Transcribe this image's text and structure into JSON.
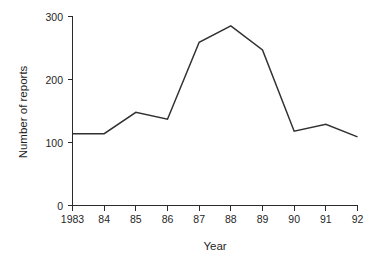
{
  "chart_data": {
    "type": "line",
    "title": "",
    "subtitle": "",
    "xlabel": "Year",
    "ylabel": "Number of reports",
    "categories": [
      "1983",
      "84",
      "85",
      "86",
      "87",
      "88",
      "89",
      "90",
      "91",
      "92"
    ],
    "x": [
      1983,
      1984,
      1985,
      1986,
      1987,
      1988,
      1989,
      1990,
      1991,
      1992
    ],
    "values": [
      114,
      114,
      148,
      137,
      259,
      285,
      247,
      118,
      129,
      109
    ],
    "series": [
      {
        "name": "Number of reports",
        "values": [
          114,
          114,
          148,
          137,
          259,
          285,
          247,
          118,
          129,
          109
        ]
      }
    ],
    "xlim": [
      1983,
      1992
    ],
    "ylim": [
      0,
      300
    ],
    "ytick_labels": [
      "0",
      "100",
      "200",
      "300"
    ],
    "ytick_values": [
      0,
      100,
      200,
      300
    ],
    "xtick_labels": [
      "1983",
      "84",
      "85",
      "86",
      "87",
      "88",
      "89",
      "90",
      "91",
      "92"
    ],
    "grid": false,
    "legend": false,
    "legend_position": "none",
    "line_color": "#33312f",
    "axis_color": "#2b2b2b",
    "background_color": "#ffffff",
    "annotations": []
  },
  "axes": {
    "y_title": "Number of reports",
    "x_title": "Year",
    "y_ticks": [
      {
        "label": "300",
        "value": 300
      },
      {
        "label": "200",
        "value": 200
      },
      {
        "label": "100",
        "value": 100
      },
      {
        "label": "0",
        "value": 0
      }
    ],
    "x_ticks": [
      {
        "label": "1983",
        "value": 1983
      },
      {
        "label": "84",
        "value": 1984
      },
      {
        "label": "85",
        "value": 1985
      },
      {
        "label": "86",
        "value": 1986
      },
      {
        "label": "87",
        "value": 1987
      },
      {
        "label": "88",
        "value": 1988
      },
      {
        "label": "89",
        "value": 1989
      },
      {
        "label": "90",
        "value": 1990
      },
      {
        "label": "91",
        "value": 1991
      },
      {
        "label": "92",
        "value": 1992
      }
    ]
  }
}
